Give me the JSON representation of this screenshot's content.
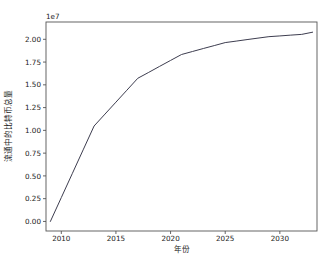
{
  "chart_data": {
    "type": "line",
    "title": "",
    "xlabel": "年份",
    "ylabel": "流通中的比特币总量",
    "y_offset_text": "1e7",
    "y_offset_multiplier": 10000000,
    "xlim": [
      2008.6,
      2033.4
    ],
    "ylim": [
      -1050000,
      21900000
    ],
    "grid": false,
    "legend": false,
    "line_color": "#3d3d4f",
    "xticks": [
      2010,
      2015,
      2020,
      2025,
      2030
    ],
    "xtick_labels": [
      "2010",
      "2015",
      "2020",
      "2025",
      "2030"
    ],
    "yticks": [
      0,
      2500000,
      5000000,
      7500000,
      10000000,
      12500000,
      15000000,
      17500000,
      20000000
    ],
    "ytick_labels": [
      "0.00",
      "0.25",
      "0.50",
      "0.75",
      "1.00",
      "1.25",
      "1.50",
      "1.75",
      "2.00"
    ],
    "series": [
      {
        "name": "流通中的比特币总量",
        "x": [
          2009,
          2010,
          2011,
          2012,
          2013,
          2014,
          2015,
          2016,
          2017,
          2018,
          2019,
          2020,
          2021,
          2022,
          2023,
          2024,
          2025,
          2026,
          2027,
          2028,
          2029,
          2030,
          2031,
          2032,
          2033
        ],
        "values": [
          0,
          2620000,
          5240000,
          7860000,
          10480000,
          11790000,
          13100000,
          14410000,
          15720000,
          16370000,
          17030000,
          17680000,
          18330000,
          18660000,
          18990000,
          19310000,
          19640000,
          19800000,
          19970000,
          20130000,
          20290000,
          20370000,
          20460000,
          20540000,
          20780000
        ]
      }
    ]
  },
  "axes": {
    "x_title": "年份",
    "y_title": "流通中的比特币总量",
    "offset_text": "1e7"
  }
}
